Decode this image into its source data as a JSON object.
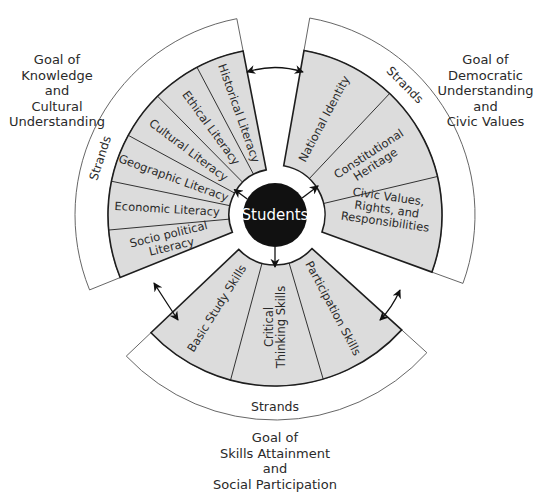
{
  "center": {
    "label": "Students",
    "cx": 275,
    "cy": 215,
    "r": 32,
    "fill": "#111111",
    "text_color": "#ffffff"
  },
  "colors": {
    "strand_fill": "#dcdcdc",
    "outline": "#1e1e1e",
    "ring_stroke": "#555555",
    "background": "#ffffff"
  },
  "goals": [
    {
      "id": "knowledge",
      "label": "Goal of\nKnowledge\nand\nCultural\nUnderstanding",
      "ring_label": "Strands",
      "start_deg": 101,
      "end_deg": 202,
      "inner_r": 46,
      "outer_r": 167,
      "ring_r": 200,
      "strands": [
        "Historical Literacy",
        "Ethical Literacy",
        "Cultural Literacy",
        "Geographic Literacy",
        "Economic Literacy",
        "Socio political Literacy"
      ]
    },
    {
      "id": "democratic",
      "label": "Goal of\nDemocratic\nUnderstanding\nand\nCivic Values",
      "ring_label": "Strands",
      "start_deg": -20,
      "end_deg": 80,
      "inner_r": 50,
      "outer_r": 167,
      "ring_r": 200,
      "strands": [
        "Civic Values, Rights, and Responsibilities",
        "Constitutional Heritage",
        "National Identity"
      ]
    },
    {
      "id": "skills",
      "label": "Goal of\nSkills Attainment\nand\nSocial Participation",
      "ring_label": "Strands",
      "start_deg": 223.5,
      "end_deg": 317.8,
      "inner_r": 50,
      "outer_r": 171,
      "ring_r": 205,
      "strands": [
        "Basic Study Skills",
        "Critical Thinking Skills",
        "Participation Skills"
      ]
    }
  ]
}
